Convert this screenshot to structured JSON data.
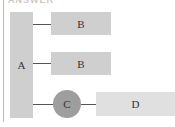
{
  "header": {
    "title": "ANSWER"
  },
  "diagram": {
    "nodes": {
      "a": {
        "label": "A"
      },
      "b1": {
        "label": "B"
      },
      "b2": {
        "label": "B"
      },
      "c": {
        "label": "C"
      },
      "d": {
        "label": "D"
      }
    },
    "edges": [
      {
        "from": "A",
        "to": "B"
      },
      {
        "from": "A",
        "to": "B"
      },
      {
        "from": "A",
        "to": "C"
      },
      {
        "from": "C",
        "to": "D"
      }
    ],
    "colors": {
      "block": "#cfcfcf",
      "block_light": "#e0e0e0",
      "circle": "#9e9e9e",
      "line": "#555555"
    }
  }
}
